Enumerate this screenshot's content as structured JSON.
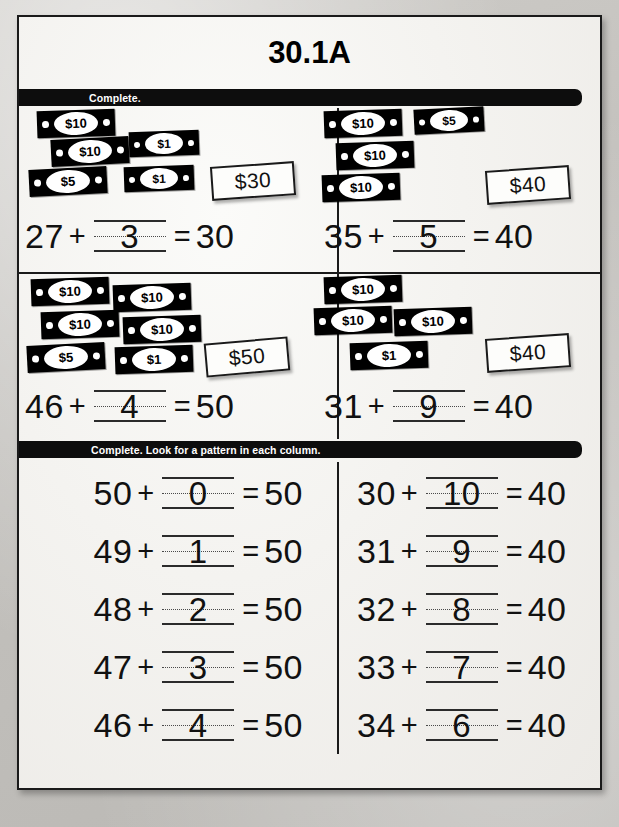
{
  "worksheet": {
    "title": "30.1A",
    "instruction_bars": [
      {
        "text": "Complete."
      },
      {
        "text": "Complete. Look for a pattern in each column."
      }
    ]
  },
  "money_problems": [
    {
      "id": "problem-1",
      "tag": "$30",
      "bills": [
        {
          "value": "$10",
          "size": "big",
          "x": 18,
          "y": 4,
          "rot": -2
        },
        {
          "value": "$10",
          "size": "big",
          "x": 32,
          "y": 32,
          "rot": -3
        },
        {
          "value": "$1",
          "size": "small",
          "x": 110,
          "y": 25,
          "rot": -2
        },
        {
          "value": "$5",
          "size": "big",
          "x": 10,
          "y": 62,
          "rot": -3
        },
        {
          "value": "$1",
          "size": "small",
          "x": 105,
          "y": 60,
          "rot": -2
        }
      ],
      "tag_x": 192,
      "tag_y": 58,
      "tag_w": 84,
      "tag_h": 34,
      "tag_rot": -4,
      "equation": {
        "left": "27",
        "op_plus": "+",
        "answer": "3",
        "op_eq": "=",
        "right": "30"
      }
    },
    {
      "id": "problem-2",
      "tag": "$40",
      "bills": [
        {
          "value": "$10",
          "size": "big",
          "x": 14,
          "y": 4,
          "rot": -2
        },
        {
          "value": "$5",
          "size": "small",
          "x": 104,
          "y": 2,
          "rot": -3
        },
        {
          "value": "$10",
          "size": "big",
          "x": 26,
          "y": 36,
          "rot": -2
        },
        {
          "value": "$10",
          "size": "big",
          "x": 12,
          "y": 68,
          "rot": -2
        }
      ],
      "tag_x": 176,
      "tag_y": 62,
      "tag_w": 84,
      "tag_h": 34,
      "tag_rot": -4,
      "equation": {
        "left": "35",
        "op_plus": "+",
        "answer": "5",
        "op_eq": "=",
        "right": "40"
      }
    },
    {
      "id": "problem-3",
      "tag": "$50",
      "bills": [
        {
          "value": "$10",
          "size": "big",
          "x": 12,
          "y": 4,
          "rot": -2
        },
        {
          "value": "$10",
          "size": "big",
          "x": 94,
          "y": 10,
          "rot": -2
        },
        {
          "value": "$10",
          "size": "big",
          "x": 22,
          "y": 37,
          "rot": -2
        },
        {
          "value": "$10",
          "size": "big",
          "x": 104,
          "y": 42,
          "rot": -2
        },
        {
          "value": "$5",
          "size": "big",
          "x": 8,
          "y": 70,
          "rot": -3
        },
        {
          "value": "$1",
          "size": "big",
          "x": 96,
          "y": 72,
          "rot": -2
        }
      ],
      "tag_x": 186,
      "tag_y": 66,
      "tag_w": 84,
      "tag_h": 34,
      "tag_rot": -5,
      "equation": {
        "left": "46",
        "op_plus": "+",
        "answer": "4",
        "op_eq": "=",
        "right": "50"
      }
    },
    {
      "id": "problem-4",
      "tag": "$40",
      "bills": [
        {
          "value": "$10",
          "size": "big",
          "x": 14,
          "y": 2,
          "rot": -2
        },
        {
          "value": "$10",
          "size": "big",
          "x": 4,
          "y": 33,
          "rot": -2
        },
        {
          "value": "$10",
          "size": "big",
          "x": 84,
          "y": 34,
          "rot": -2
        },
        {
          "value": "$1",
          "size": "big",
          "x": 40,
          "y": 68,
          "rot": -2
        }
      ],
      "tag_x": 176,
      "tag_y": 62,
      "tag_w": 84,
      "tag_h": 34,
      "tag_rot": -4,
      "equation": {
        "left": "31",
        "op_plus": "+",
        "answer": "9",
        "op_eq": "=",
        "right": "40"
      }
    }
  ],
  "pattern_columns": {
    "left": [
      {
        "left": "50",
        "op_plus": "+",
        "answer": "0",
        "op_eq": "=",
        "right": "50"
      },
      {
        "left": "49",
        "op_plus": "+",
        "answer": "1",
        "op_eq": "=",
        "right": "50"
      },
      {
        "left": "48",
        "op_plus": "+",
        "answer": "2",
        "op_eq": "=",
        "right": "50"
      },
      {
        "left": "47",
        "op_plus": "+",
        "answer": "3",
        "op_eq": "=",
        "right": "50"
      },
      {
        "left": "46",
        "op_plus": "+",
        "answer": "4",
        "op_eq": "=",
        "right": "50"
      }
    ],
    "right": [
      {
        "left": "30",
        "op_plus": "+",
        "answer": "10",
        "op_eq": "=",
        "right": "40"
      },
      {
        "left": "31",
        "op_plus": "+",
        "answer": "9",
        "op_eq": "=",
        "right": "40"
      },
      {
        "left": "32",
        "op_plus": "+",
        "answer": "8",
        "op_eq": "=",
        "right": "40"
      },
      {
        "left": "33",
        "op_plus": "+",
        "answer": "7",
        "op_eq": "=",
        "right": "40"
      },
      {
        "left": "34",
        "op_plus": "+",
        "answer": "6",
        "op_eq": "=",
        "right": "40"
      }
    ]
  },
  "colors": {
    "ink": "#111111",
    "bar": "#0d0d0d",
    "bar_text": "#ffffff",
    "paper": "#f4f3f0",
    "scan_background": "#c4c2be"
  }
}
